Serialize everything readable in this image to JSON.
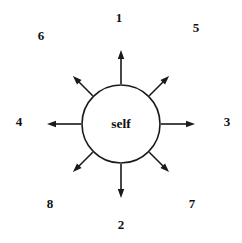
{
  "diagram": {
    "type": "radial-node-diagram",
    "center": {
      "label": "self",
      "shape": "circle",
      "cx": 121,
      "cy": 124,
      "r": 39,
      "stroke_color": "#1a1a1a",
      "stroke_width": 1.6,
      "fill_color": "#ffffff"
    },
    "background_color": "#ffffff",
    "arrow": {
      "stroke_color": "#1a1a1a",
      "stroke_width": 1.6,
      "head_style": "solid-filled-triangle",
      "head_length": 9,
      "head_width": 6.5,
      "count": 8
    },
    "spokes": [
      {
        "label": "1",
        "direction": "up",
        "angle_deg": 270,
        "tip_radius": 74,
        "label_x": 119,
        "label_y": 17
      },
      {
        "label": "5",
        "direction": "up-right",
        "angle_deg": 315,
        "tip_radius": 68,
        "label_x": 196,
        "label_y": 27
      },
      {
        "label": "3",
        "direction": "right",
        "angle_deg": 0,
        "tip_radius": 74,
        "label_x": 227,
        "label_y": 121
      },
      {
        "label": "7",
        "direction": "down-right",
        "angle_deg": 45,
        "tip_radius": 68,
        "label_x": 192,
        "label_y": 203
      },
      {
        "label": "2",
        "direction": "down",
        "angle_deg": 90,
        "tip_radius": 74,
        "label_x": 121,
        "label_y": 224
      },
      {
        "label": "8",
        "direction": "down-left",
        "angle_deg": 135,
        "tip_radius": 68,
        "label_x": 50,
        "label_y": 203
      },
      {
        "label": "4",
        "direction": "left",
        "angle_deg": 180,
        "tip_radius": 74,
        "label_x": 19,
        "label_y": 121
      },
      {
        "label": "6",
        "direction": "up-left",
        "angle_deg": 225,
        "tip_radius": 68,
        "label_x": 41,
        "label_y": 35
      }
    ]
  }
}
